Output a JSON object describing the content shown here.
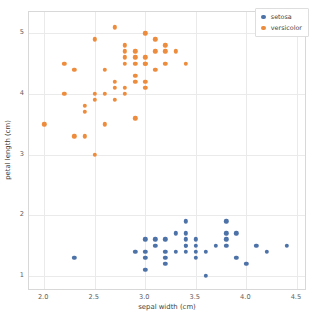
{
  "chart_data": {
    "type": "scatter",
    "title": "",
    "xlabel": "sepal width (cm)",
    "ylabel": "petal length (cm)",
    "xlim": [
      1.85,
      4.6
    ],
    "ylim": [
      0.75,
      5.35
    ],
    "xticks": [
      "2.0",
      "2.5",
      "3.0",
      "3.5",
      "4.0",
      "4.5"
    ],
    "xtick_values": [
      2.0,
      2.5,
      3.0,
      3.5,
      4.0,
      4.5
    ],
    "yticks": [
      "1",
      "2",
      "3",
      "4",
      "5"
    ],
    "ytick_values": [
      1,
      2,
      3,
      4,
      5
    ],
    "grid": true,
    "legend_position": "upper right",
    "legend_entries": [
      "setosa",
      "versicolor"
    ],
    "colors": [
      "#4c72a8",
      "#ed8c3c"
    ],
    "series": [
      {
        "name": "setosa",
        "color": "#4c72a8",
        "points": [
          [
            2.3,
            1.3
          ],
          [
            2.9,
            1.4
          ],
          [
            3.0,
            1.6
          ],
          [
            3.0,
            1.4
          ],
          [
            3.0,
            1.3
          ],
          [
            3.0,
            1.1
          ],
          [
            3.1,
            1.6
          ],
          [
            3.1,
            1.5
          ],
          [
            3.2,
            1.6
          ],
          [
            3.2,
            1.4
          ],
          [
            3.2,
            1.3
          ],
          [
            3.2,
            1.2
          ],
          [
            3.3,
            1.7
          ],
          [
            3.3,
            1.4
          ],
          [
            3.4,
            1.9
          ],
          [
            3.4,
            1.7
          ],
          [
            3.4,
            1.6
          ],
          [
            3.4,
            1.5
          ],
          [
            3.4,
            1.5
          ],
          [
            3.4,
            1.4
          ],
          [
            3.5,
            1.6
          ],
          [
            3.5,
            1.5
          ],
          [
            3.5,
            1.4
          ],
          [
            3.5,
            1.3
          ],
          [
            3.6,
            1.4
          ],
          [
            3.6,
            1.0
          ],
          [
            3.7,
            1.5
          ],
          [
            3.8,
            1.9
          ],
          [
            3.8,
            1.7
          ],
          [
            3.8,
            1.6
          ],
          [
            3.8,
            1.5
          ],
          [
            3.9,
            1.7
          ],
          [
            3.9,
            1.3
          ],
          [
            4.0,
            1.2
          ],
          [
            4.1,
            1.5
          ],
          [
            4.2,
            1.4
          ],
          [
            4.4,
            1.5
          ]
        ]
      },
      {
        "name": "versicolor",
        "color": "#ed8c3c",
        "points": [
          [
            2.0,
            3.5
          ],
          [
            2.2,
            4.5
          ],
          [
            2.2,
            4.0
          ],
          [
            2.3,
            4.4
          ],
          [
            2.3,
            3.3
          ],
          [
            2.4,
            3.8
          ],
          [
            2.4,
            3.7
          ],
          [
            2.4,
            3.3
          ],
          [
            2.5,
            4.9
          ],
          [
            2.5,
            4.0
          ],
          [
            2.5,
            3.9
          ],
          [
            2.5,
            3.0
          ],
          [
            2.6,
            4.4
          ],
          [
            2.6,
            4.0
          ],
          [
            2.6,
            3.5
          ],
          [
            2.7,
            5.1
          ],
          [
            2.7,
            4.2
          ],
          [
            2.7,
            4.1
          ],
          [
            2.7,
            3.9
          ],
          [
            2.8,
            4.8
          ],
          [
            2.8,
            4.7
          ],
          [
            2.8,
            4.6
          ],
          [
            2.8,
            4.5
          ],
          [
            2.8,
            4.1
          ],
          [
            2.8,
            4.0
          ],
          [
            2.9,
            4.7
          ],
          [
            2.9,
            4.6
          ],
          [
            2.9,
            4.5
          ],
          [
            2.9,
            4.3
          ],
          [
            2.9,
            4.2
          ],
          [
            2.9,
            3.6
          ],
          [
            3.0,
            5.0
          ],
          [
            3.0,
            4.6
          ],
          [
            3.0,
            4.5
          ],
          [
            3.0,
            4.5
          ],
          [
            3.0,
            4.2
          ],
          [
            3.0,
            4.1
          ],
          [
            3.1,
            4.9
          ],
          [
            3.1,
            4.7
          ],
          [
            3.1,
            4.4
          ],
          [
            3.2,
            4.8
          ],
          [
            3.2,
            4.7
          ],
          [
            3.2,
            4.5
          ],
          [
            3.3,
            4.7
          ],
          [
            3.4,
            4.5
          ]
        ]
      }
    ]
  }
}
